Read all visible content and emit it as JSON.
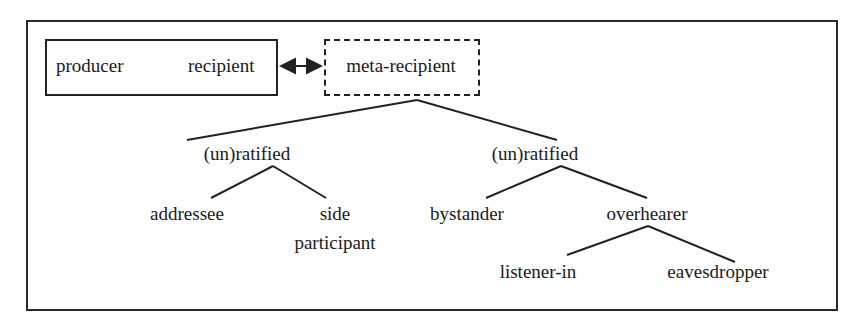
{
  "diagram": {
    "type": "participation-framework-tree",
    "top_row": {
      "solid_box": {
        "left_label": "producer",
        "right_label": "recipient"
      },
      "arrow": "bidirectional",
      "dashed_box": {
        "label": "meta-recipient"
      }
    },
    "branches": [
      {
        "label": "(un)ratified",
        "children": [
          {
            "label": "addressee"
          },
          {
            "label_line1": "side",
            "label_line2": "participant"
          }
        ]
      },
      {
        "label": "(un)ratified",
        "children": [
          {
            "label": "bystander"
          },
          {
            "label": "overhearer",
            "children": [
              {
                "label": "listener-in"
              },
              {
                "label": "eavesdropper"
              }
            ]
          }
        ]
      }
    ],
    "colors": {
      "line": "#222222",
      "text": "#1a1a1a",
      "background": "#ffffff"
    }
  }
}
